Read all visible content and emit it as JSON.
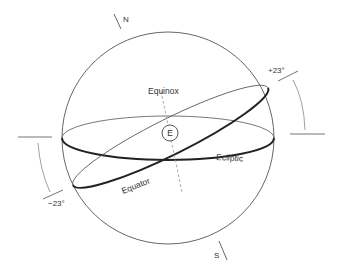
{
  "diagram": {
    "type": "celestial-sphere",
    "labels": {
      "north": "N",
      "south": "S",
      "equinox": "Equinox",
      "earth": "E",
      "ecliptic": "Ecliptic",
      "equator": "Equator",
      "plus_angle": "+23°",
      "minus_angle": "−23°"
    },
    "colors": {
      "line": "#555555",
      "thick_line": "#222222",
      "dashed_axis": "#999999",
      "text": "#333333",
      "background": "#ffffff"
    }
  }
}
